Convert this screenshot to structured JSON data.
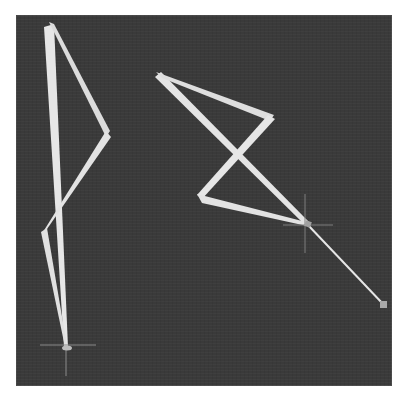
{
  "scene": {
    "width": 406,
    "height": 401,
    "panel": {
      "x": 16,
      "y": 15,
      "w": 376,
      "h": 371,
      "color": "#3a3a3a"
    },
    "stroke_color": "#e6e6e6",
    "crosshair_color": "#8a8a8a",
    "marker_color": "#a8a8a8"
  },
  "figures": [
    {
      "name": "left-bone-chain",
      "points": [
        [
          49,
          25
        ],
        [
          108,
          135
        ],
        [
          43,
          232
        ],
        [
          66,
          347
        ]
      ],
      "spine": [
        [
          49,
          25
        ],
        [
          66,
          347
        ]
      ],
      "root_crosshair": [
        66,
        347
      ]
    },
    {
      "name": "right-bone-chain",
      "points": [
        [
          157,
          75
        ],
        [
          272,
          117
        ],
        [
          200,
          198
        ],
        [
          307,
          224
        ],
        [
          384,
          305
        ]
      ],
      "diagonal": [
        [
          157,
          75
        ],
        [
          307,
          224
        ]
      ],
      "target_crosshair": [
        307,
        224
      ],
      "end_marker": [
        384,
        305
      ]
    }
  ]
}
